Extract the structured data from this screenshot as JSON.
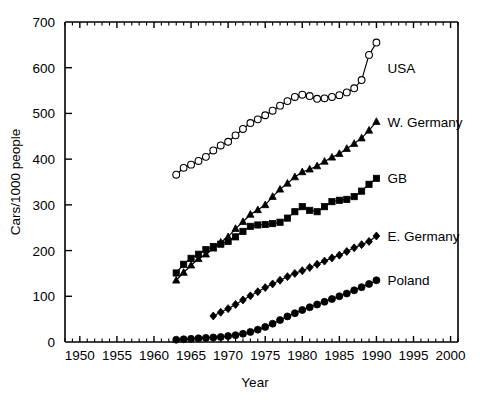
{
  "chart_data": {
    "type": "line",
    "title": "",
    "xlabel": "Year",
    "ylabel": "Cars/1000 people",
    "xlim": [
      1948,
      2001
    ],
    "ylim": [
      0,
      700
    ],
    "xticks": [
      1950,
      1955,
      1960,
      1965,
      1970,
      1975,
      1980,
      1985,
      1990,
      1995,
      2000
    ],
    "yticks": [
      0,
      100,
      200,
      300,
      400,
      500,
      600,
      700
    ],
    "xtick_labels": [
      "1950",
      "1955",
      "1960",
      "1965",
      "1970",
      "1975",
      "1980",
      "1985",
      "1990",
      "1995",
      "2000"
    ],
    "ytick_labels": [
      "0",
      "100",
      "200",
      "300",
      "400",
      "500",
      "600",
      "700"
    ],
    "minor_tick_interval": 1,
    "grid": false,
    "legend_position": "inline-right-of-series",
    "series": [
      {
        "name": "USA",
        "label": "USA",
        "marker": "open-circle",
        "color": "#000000",
        "x": [
          1963,
          1964,
          1965,
          1966,
          1967,
          1968,
          1969,
          1970,
          1971,
          1972,
          1973,
          1974,
          1975,
          1976,
          1977,
          1978,
          1979,
          1980,
          1981,
          1982,
          1983,
          1984,
          1985,
          1986,
          1987,
          1988,
          1989,
          1990
        ],
        "y": [
          366,
          381,
          388,
          396,
          405,
          419,
          430,
          438,
          452,
          466,
          479,
          487,
          496,
          506,
          517,
          527,
          536,
          541,
          538,
          532,
          533,
          536,
          540,
          546,
          555,
          573,
          628,
          655
        ]
      },
      {
        "name": "W. Germany",
        "label": "W. Germany",
        "marker": "triangle",
        "color": "#000000",
        "x": [
          1963,
          1964,
          1965,
          1966,
          1967,
          1968,
          1969,
          1970,
          1971,
          1972,
          1973,
          1974,
          1975,
          1976,
          1977,
          1978,
          1979,
          1980,
          1981,
          1982,
          1983,
          1984,
          1985,
          1986,
          1987,
          1988,
          1989,
          1990
        ],
        "y": [
          135,
          152,
          168,
          182,
          192,
          205,
          218,
          230,
          248,
          263,
          279,
          289,
          300,
          318,
          334,
          347,
          361,
          372,
          378,
          385,
          395,
          404,
          412,
          423,
          434,
          446,
          463,
          482
        ]
      },
      {
        "name": "GB",
        "label": "GB",
        "marker": "square",
        "color": "#000000",
        "x": [
          1963,
          1964,
          1965,
          1966,
          1967,
          1968,
          1969,
          1970,
          1971,
          1972,
          1973,
          1974,
          1975,
          1976,
          1977,
          1978,
          1979,
          1980,
          1981,
          1982,
          1983,
          1984,
          1985,
          1986,
          1987,
          1988,
          1989,
          1990
        ],
        "y": [
          151,
          170,
          183,
          192,
          202,
          209,
          214,
          220,
          230,
          242,
          253,
          256,
          257,
          259,
          262,
          271,
          285,
          296,
          288,
          285,
          296,
          307,
          310,
          312,
          318,
          330,
          345,
          358
        ]
      },
      {
        "name": "E. Germany",
        "label": "E. Germany",
        "marker": "diamond",
        "color": "#000000",
        "x": [
          1968,
          1969,
          1970,
          1971,
          1972,
          1973,
          1974,
          1975,
          1976,
          1977,
          1978,
          1979,
          1980,
          1981,
          1982,
          1983,
          1984,
          1985,
          1986,
          1987,
          1988,
          1989,
          1990
        ],
        "y": [
          57,
          65,
          73,
          82,
          92,
          101,
          110,
          119,
          127,
          135,
          143,
          150,
          156,
          163,
          170,
          177,
          184,
          190,
          198,
          206,
          213,
          220,
          232
        ]
      },
      {
        "name": "Poland",
        "label": "Poland",
        "marker": "filled-circle",
        "color": "#000000",
        "x": [
          1963,
          1964,
          1965,
          1966,
          1967,
          1968,
          1969,
          1970,
          1971,
          1972,
          1973,
          1974,
          1975,
          1976,
          1977,
          1978,
          1979,
          1980,
          1981,
          1982,
          1983,
          1984,
          1985,
          1986,
          1987,
          1988,
          1989,
          1990
        ],
        "y": [
          5,
          6,
          7,
          8,
          9,
          10,
          11,
          13,
          15,
          18,
          22,
          27,
          33,
          40,
          48,
          56,
          63,
          70,
          76,
          82,
          88,
          94,
          100,
          106,
          113,
          120,
          127,
          135
        ]
      }
    ],
    "series_label_positions": [
      {
        "name": "USA",
        "x": 1991.5,
        "y": 600
      },
      {
        "name": "W. Germany",
        "x": 1991.5,
        "y": 482
      },
      {
        "name": "GB",
        "x": 1991.5,
        "y": 358
      },
      {
        "name": "E. Germany",
        "x": 1991.5,
        "y": 232
      },
      {
        "name": "Poland",
        "x": 1991.5,
        "y": 135
      }
    ]
  }
}
